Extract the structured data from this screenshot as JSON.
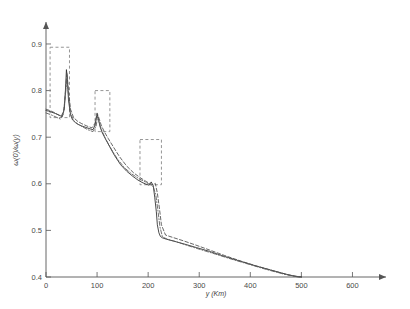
{
  "chart_data": {
    "type": "line",
    "title": "",
    "xlabel": "y (Km)",
    "ylabel": "ω(0)/ω(y)",
    "xlim": [
      0,
      650
    ],
    "ylim": [
      0.4,
      0.93
    ],
    "xticks": [
      0,
      100,
      200,
      300,
      400,
      500,
      600
    ],
    "xtick_labels": [
      "0",
      "100",
      "200",
      "300",
      "400",
      "500",
      "600"
    ],
    "yticks": [
      0.4,
      0.5,
      0.6,
      0.7,
      0.8,
      0.9
    ],
    "ytick_labels": [
      "0.4",
      "0.5",
      "0.6",
      "0.7",
      "0.8",
      "0.9"
    ],
    "grid": false,
    "legend": "none",
    "series": [
      {
        "name": "solid",
        "style": "solid",
        "color": "#2b2b2b",
        "x": [
          0,
          5,
          10,
          18,
          26,
          32,
          36,
          38,
          40,
          42,
          44,
          48,
          52,
          58,
          64,
          70,
          78,
          86,
          92,
          96,
          100,
          103,
          106,
          110,
          116,
          124,
          134,
          146,
          158,
          170,
          180,
          188,
          196,
          202,
          206,
          210,
          213,
          216,
          218,
          221,
          224,
          228,
          236,
          250,
          270,
          295,
          320,
          350,
          380,
          410,
          440,
          470,
          490,
          500
        ],
        "y": [
          0.757,
          0.756,
          0.754,
          0.751,
          0.747,
          0.744,
          0.762,
          0.8,
          0.845,
          0.823,
          0.78,
          0.748,
          0.737,
          0.731,
          0.727,
          0.724,
          0.721,
          0.718,
          0.716,
          0.726,
          0.75,
          0.737,
          0.722,
          0.71,
          0.697,
          0.681,
          0.661,
          0.641,
          0.627,
          0.616,
          0.608,
          0.603,
          0.599,
          0.597,
          0.604,
          0.596,
          0.57,
          0.54,
          0.512,
          0.495,
          0.487,
          0.484,
          0.481,
          0.477,
          0.471,
          0.463,
          0.455,
          0.444,
          0.434,
          0.424,
          0.415,
          0.406,
          0.401,
          0.4
        ]
      },
      {
        "name": "dashed",
        "style": "dashed",
        "color": "#4d4d4d",
        "x": [
          0,
          8,
          16,
          24,
          30,
          35,
          38,
          41,
          44,
          48,
          54,
          62,
          70,
          80,
          90,
          96,
          100,
          104,
          108,
          114,
          122,
          132,
          144,
          158,
          172,
          186,
          196,
          204,
          210,
          214,
          218,
          222,
          226,
          234,
          248,
          268,
          292,
          320,
          350,
          382,
          414,
          446,
          476,
          500
        ],
        "y": [
          0.76,
          0.757,
          0.753,
          0.748,
          0.745,
          0.758,
          0.796,
          0.838,
          0.8,
          0.76,
          0.742,
          0.734,
          0.729,
          0.724,
          0.72,
          0.73,
          0.752,
          0.74,
          0.726,
          0.712,
          0.697,
          0.679,
          0.658,
          0.638,
          0.623,
          0.612,
          0.605,
          0.6,
          0.598,
          0.601,
          0.58,
          0.548,
          0.512,
          0.49,
          0.485,
          0.478,
          0.469,
          0.458,
          0.446,
          0.434,
          0.423,
          0.413,
          0.404,
          0.4
        ]
      },
      {
        "name": "dash-dot",
        "style": "dashdot",
        "color": "#5a5a5a",
        "x": [
          0,
          10,
          20,
          28,
          34,
          38,
          41,
          44,
          48,
          54,
          62,
          72,
          82,
          92,
          98,
          101,
          105,
          110,
          118,
          128,
          140,
          154,
          168,
          182,
          194,
          204,
          210,
          215,
          219,
          223,
          228,
          238,
          254,
          276,
          302,
          332,
          364,
          398,
          432,
          466,
          494,
          500
        ],
        "y": [
          0.752,
          0.748,
          0.743,
          0.739,
          0.75,
          0.79,
          0.826,
          0.79,
          0.752,
          0.736,
          0.728,
          0.722,
          0.716,
          0.712,
          0.723,
          0.744,
          0.728,
          0.712,
          0.694,
          0.674,
          0.653,
          0.634,
          0.621,
          0.611,
          0.604,
          0.598,
          0.594,
          0.576,
          0.544,
          0.508,
          0.486,
          0.481,
          0.476,
          0.468,
          0.459,
          0.449,
          0.438,
          0.427,
          0.416,
          0.406,
          0.4,
          0.4
        ]
      }
    ],
    "annotation_boxes": [
      {
        "name": "box-1",
        "x0": 8,
        "x1": 46,
        "y_top": 0.893,
        "y_bottom": 0.742,
        "style": "dashed"
      },
      {
        "name": "box-2",
        "x0": 96,
        "x1": 125,
        "y_top": 0.8,
        "y_bottom": 0.712,
        "style": "dashed"
      },
      {
        "name": "box-3",
        "x0": 184,
        "x1": 226,
        "y_top": 0.695,
        "y_bottom": 0.598,
        "style": "dashed"
      }
    ]
  }
}
